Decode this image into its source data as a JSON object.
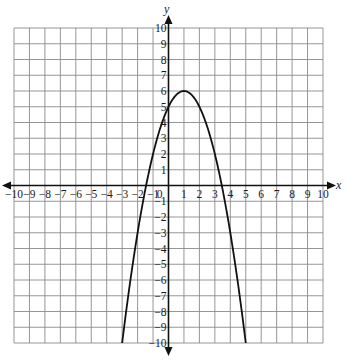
{
  "chart_data": {
    "type": "line",
    "title": "",
    "xlabel": "x",
    "ylabel": "y",
    "xlim": [
      -10,
      10
    ],
    "ylim": [
      -10,
      10
    ],
    "grid": true,
    "x_ticks": [
      -10,
      -9,
      -8,
      -7,
      -6,
      -5,
      -4,
      -3,
      -2,
      -1,
      0,
      1,
      2,
      3,
      4,
      5,
      6,
      7,
      8,
      9,
      10
    ],
    "y_ticks": [
      -10,
      -9,
      -8,
      -7,
      -6,
      -5,
      -4,
      -3,
      -2,
      -1,
      1,
      2,
      3,
      4,
      5,
      6,
      7,
      8,
      9,
      10
    ],
    "series": [
      {
        "name": "parabola",
        "equation": "y = -(x-1)^2 + 6",
        "vertex": [
          1,
          6
        ],
        "x_intercepts": [
          -1.45,
          3.45
        ],
        "y_intercept": 5,
        "x": [
          -3,
          -2,
          -1,
          0,
          1,
          2,
          3,
          4,
          5
        ],
        "y": [
          -10,
          -3,
          2,
          5,
          6,
          5,
          2,
          -3,
          -10
        ]
      }
    ]
  }
}
